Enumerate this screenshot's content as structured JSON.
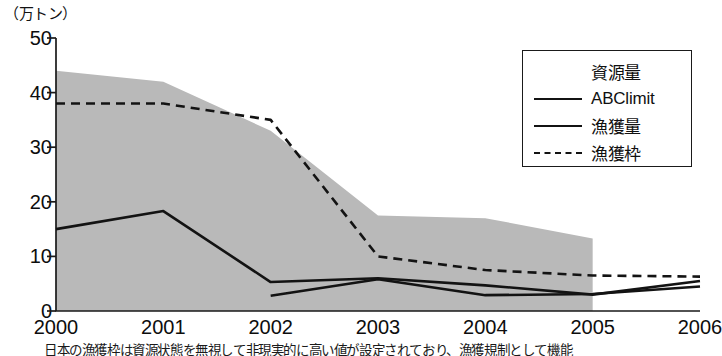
{
  "chart_data": {
    "type": "area",
    "title": "",
    "subtitle": "",
    "unit_label": "（万トン）",
    "xlabel": "",
    "ylabel": "万トン",
    "categories": [
      "2000",
      "2001",
      "2002",
      "2003",
      "2004",
      "2005",
      "2006"
    ],
    "x": [
      2000,
      2001,
      2002,
      2003,
      2004,
      2005,
      2006
    ],
    "xlim": [
      2000,
      2006
    ],
    "ylim": [
      0,
      50
    ],
    "yticks": [
      "0",
      "10",
      "20",
      "30",
      "40",
      "50"
    ],
    "ytick_values": [
      0,
      10,
      20,
      30,
      40,
      50
    ],
    "grid": false,
    "legend_position": "top-right",
    "series": [
      {
        "name": "資源量",
        "style": "area",
        "color": "#b9b9b9",
        "x": [
          2000,
          2001,
          2002,
          2003,
          2004,
          2005
        ],
        "values": [
          44,
          42,
          33,
          17.5,
          17,
          13.3
        ]
      },
      {
        "name": "ABClimit",
        "style": "solid-line",
        "color": "#131313",
        "x": [
          2002,
          2003,
          2004,
          2005,
          2006
        ],
        "values": [
          2.8,
          5.8,
          2.9,
          3.1,
          4.5
        ]
      },
      {
        "name": "漁獲量",
        "style": "solid-line",
        "color": "#131313",
        "x": [
          2000,
          2001,
          2002,
          2003,
          2004,
          2005,
          2006
        ],
        "values": [
          15,
          18.3,
          5.3,
          6,
          4.7,
          3,
          5.5
        ]
      },
      {
        "name": "漁獲枠",
        "style": "dashed-line",
        "color": "#131313",
        "x": [
          2000,
          2001,
          2002,
          2003,
          2004,
          2005,
          2006
        ],
        "values": [
          38,
          38,
          35,
          10,
          7.5,
          6.5,
          6.3
        ]
      }
    ]
  },
  "legend": {
    "items": [
      {
        "label": "資源量",
        "key": "area-swatch"
      },
      {
        "label": "ABClimit",
        "key": "solid-line"
      },
      {
        "label": "漁獲量",
        "key": "solid-line"
      },
      {
        "label": "漁獲枠",
        "key": "dashed-line"
      }
    ]
  },
  "caption": {
    "text": "日本の漁獲枠は資源状態を無視して非現実的に高い値が設定されており、漁獲規制として機能"
  }
}
